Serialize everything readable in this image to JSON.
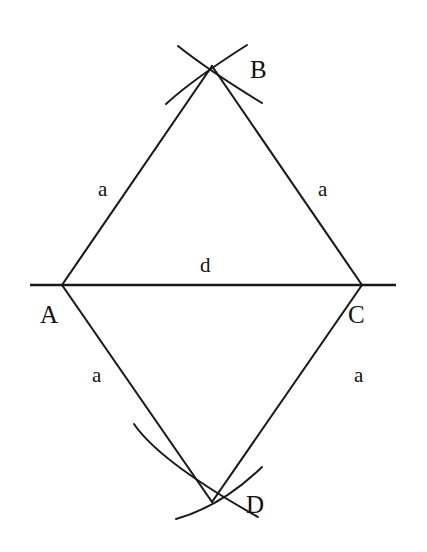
{
  "figure": {
    "background_color": "#ffffff",
    "stroke_color": "#1a1a1a",
    "vertices": [
      {
        "id": "A",
        "label": "A",
        "x": 62,
        "y": 285
      },
      {
        "id": "B",
        "label": "B",
        "x": 212,
        "y": 66
      },
      {
        "id": "C",
        "label": "C",
        "x": 362,
        "y": 285
      },
      {
        "id": "D",
        "label": "D",
        "x": 212,
        "y": 502
      }
    ],
    "vertex_labels": [
      {
        "id": "A",
        "text": "A",
        "x": 40,
        "y": 323
      },
      {
        "id": "B",
        "text": "B",
        "x": 250,
        "y": 78
      },
      {
        "id": "C",
        "text": "C",
        "x": 348,
        "y": 323
      },
      {
        "id": "D",
        "text": "D",
        "x": 246,
        "y": 513
      }
    ],
    "edges": [
      {
        "id": "AB",
        "from": "A",
        "to": "B",
        "label": "a"
      },
      {
        "id": "BC",
        "from": "B",
        "to": "C",
        "label": "a"
      },
      {
        "id": "AD",
        "from": "A",
        "to": "D",
        "label": "a"
      },
      {
        "id": "DC",
        "from": "D",
        "to": "C",
        "label": "a"
      }
    ],
    "edge_labels": [
      {
        "id": "label-ab",
        "text": "a",
        "x": 98,
        "y": 196
      },
      {
        "id": "label-bc",
        "text": "a",
        "x": 318,
        "y": 196
      },
      {
        "id": "label-ad",
        "text": "a",
        "x": 92,
        "y": 382
      },
      {
        "id": "label-dc",
        "text": "a",
        "x": 354,
        "y": 382
      }
    ],
    "diagonal": {
      "id": "AC",
      "from": "A",
      "to": "C",
      "label": "d",
      "extends_beyond_vertices": true,
      "line_start_x": 30,
      "line_end_x": 396,
      "line_y": 285,
      "label_x": 200,
      "label_y": 272
    },
    "construction_arcs": {
      "at_B": {
        "count": 4,
        "description": "two compass arcs crossing at vertex B"
      },
      "at_D": {
        "count": 4,
        "description": "two compass arcs crossing at vertex D"
      }
    }
  }
}
